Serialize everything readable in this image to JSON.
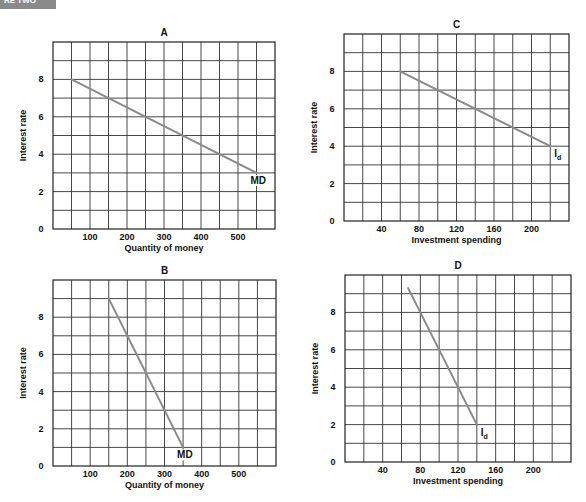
{
  "header_tab": {
    "label": "RE TWO"
  },
  "chart_data": [
    {
      "id": "A",
      "type": "line",
      "title": "A",
      "xlabel": "Quantity of money",
      "ylabel": "Interest rate",
      "xlim": [
        0,
        600
      ],
      "ylim": [
        0,
        10
      ],
      "x_grid_step": 50,
      "y_grid_step": 1,
      "xticks": [
        100,
        200,
        300,
        400,
        500
      ],
      "yticks": [
        0,
        2,
        4,
        6,
        8
      ],
      "grid": true,
      "series": [
        {
          "name": "MD",
          "label": "MD",
          "x": [
            50,
            550
          ],
          "y": [
            8,
            3
          ]
        }
      ],
      "plot_box": [
        53,
        42,
        275,
        229
      ]
    },
    {
      "id": "C",
      "type": "line",
      "title": "C",
      "xlabel": "Investment spending",
      "ylabel": "Interest rate",
      "xlim": [
        0,
        240
      ],
      "ylim": [
        0,
        10
      ],
      "x_grid_step": 20,
      "y_grid_step": 1,
      "xticks": [
        40,
        80,
        120,
        160,
        200
      ],
      "yticks": [
        0,
        2,
        4,
        6,
        8
      ],
      "grid": true,
      "series": [
        {
          "name": "Id",
          "label": "I",
          "label_sub": "d",
          "x": [
            60,
            220
          ],
          "y": [
            8,
            4
          ]
        }
      ],
      "plot_box": [
        344,
        34,
        569,
        221
      ]
    },
    {
      "id": "B",
      "type": "line",
      "title": "B",
      "xlabel": "Quantity of money",
      "ylabel": "Interest rate",
      "xlim": [
        0,
        600
      ],
      "ylim": [
        0,
        10
      ],
      "x_grid_step": 50,
      "y_grid_step": 1,
      "xticks": [
        100,
        200,
        300,
        400,
        500
      ],
      "yticks": [
        0,
        2,
        4,
        6,
        8
      ],
      "grid": true,
      "series": [
        {
          "name": "MD",
          "label": "MD",
          "x": [
            150,
            350
          ],
          "y": [
            9,
            1
          ]
        }
      ],
      "plot_box": [
        53,
        280,
        276,
        466
      ]
    },
    {
      "id": "D",
      "type": "line",
      "title": "D",
      "xlabel": "Investment spending",
      "ylabel": "Interest rate",
      "xlim": [
        0,
        240
      ],
      "ylim": [
        0,
        10
      ],
      "x_grid_step": 20,
      "y_grid_step": 1,
      "xticks": [
        40,
        80,
        120,
        160,
        200
      ],
      "yticks": [
        0,
        2,
        4,
        6,
        8
      ],
      "grid": true,
      "series": [
        {
          "name": "Id",
          "label": "I",
          "label_sub": "d",
          "x": [
            67,
            140
          ],
          "y": [
            9.3,
            2
          ]
        }
      ],
      "plot_box": [
        345,
        275,
        571,
        462
      ]
    }
  ],
  "colors": {
    "curve": "#8a8a8a",
    "grid": "#333333",
    "tab": "#8a8a8a"
  }
}
